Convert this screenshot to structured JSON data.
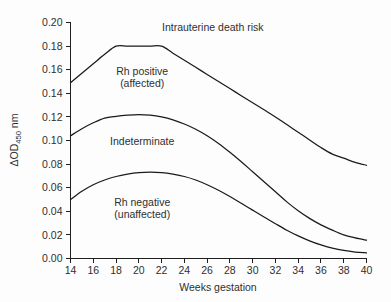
{
  "chart_data": {
    "type": "line",
    "title": "",
    "xlabel": "Weeks gestation",
    "ylabel": "ΔOD450 nm",
    "ylabel_parts": {
      "prefix": "ΔOD",
      "subscript": "450",
      "suffix": " nm"
    },
    "xlim": [
      14,
      40
    ],
    "ylim": [
      0.0,
      0.2
    ],
    "xticks": [
      14,
      16,
      18,
      20,
      22,
      24,
      26,
      28,
      30,
      32,
      34,
      36,
      38,
      40
    ],
    "yticks": [
      0.0,
      0.02,
      0.04,
      0.06,
      0.08,
      0.1,
      0.12,
      0.14,
      0.16,
      0.18,
      0.2
    ],
    "xtick_labels": [
      "14",
      "16",
      "18",
      "20",
      "22",
      "24",
      "26",
      "28",
      "30",
      "32",
      "34",
      "36",
      "38",
      "40"
    ],
    "ytick_labels": [
      "0.00",
      "0.02",
      "0.04",
      "0.06",
      "0.08",
      "0.10",
      "0.12",
      "0.14",
      "0.16",
      "0.18",
      "0.20"
    ],
    "grid": false,
    "legend": "none",
    "line_color": "#1a1a1a",
    "background_color": "#fdfdfd",
    "series": [
      {
        "name": "upper-boundary",
        "x": [
          14,
          15,
          16,
          17,
          18,
          19,
          20,
          21,
          22,
          23,
          24,
          25,
          26,
          27,
          28,
          29,
          30,
          31,
          32,
          33,
          34,
          35,
          36,
          37,
          38,
          39,
          40
        ],
        "values": [
          0.149,
          0.157,
          0.165,
          0.173,
          0.18,
          0.18,
          0.18,
          0.18,
          0.18,
          0.174,
          0.168,
          0.162,
          0.156,
          0.15,
          0.144,
          0.138,
          0.132,
          0.126,
          0.12,
          0.1135,
          0.107,
          0.1005,
          0.094,
          0.0885,
          0.085,
          0.0815,
          0.079
        ]
      },
      {
        "name": "middle-boundary",
        "x": [
          14,
          15,
          16,
          17,
          18,
          19,
          20,
          21,
          22,
          23,
          24,
          25,
          26,
          27,
          28,
          29,
          30,
          31,
          32,
          33,
          34,
          35,
          36,
          37,
          38,
          39,
          40
        ],
        "values": [
          0.104,
          0.11,
          0.115,
          0.119,
          0.1205,
          0.1215,
          0.122,
          0.1215,
          0.12,
          0.1175,
          0.114,
          0.1095,
          0.104,
          0.0975,
          0.09,
          0.082,
          0.0735,
          0.065,
          0.0565,
          0.048,
          0.0405,
          0.034,
          0.0285,
          0.024,
          0.02,
          0.0175,
          0.0155
        ]
      },
      {
        "name": "lower-boundary",
        "x": [
          14,
          15,
          16,
          17,
          18,
          19,
          20,
          21,
          22,
          23,
          24,
          25,
          26,
          27,
          28,
          29,
          30,
          31,
          32,
          33,
          34,
          35,
          36,
          37,
          38,
          39,
          40
        ],
        "values": [
          0.05,
          0.057,
          0.0625,
          0.0665,
          0.0695,
          0.0715,
          0.0728,
          0.0732,
          0.0728,
          0.0715,
          0.0695,
          0.0665,
          0.0625,
          0.0578,
          0.0525,
          0.0468,
          0.041,
          0.0352,
          0.0295,
          0.024,
          0.0192,
          0.015,
          0.0115,
          0.0088,
          0.0068,
          0.0055,
          0.0048
        ]
      }
    ],
    "annotations": [
      {
        "id": "intrauterine-death-risk",
        "text": "Intrauterine death risk",
        "x": 26.5,
        "y": 0.193
      },
      {
        "id": "rh-positive",
        "text": "Rh positive",
        "text2": "(affected)",
        "x": 20.3,
        "y": 0.1555
      },
      {
        "id": "indeterminate",
        "text": "Indeterminate",
        "x": 20.3,
        "y": 0.0965
      },
      {
        "id": "rh-negative",
        "text": "Rh negative",
        "text2": "(unaffected)",
        "x": 20.3,
        "y": 0.0445
      }
    ]
  }
}
